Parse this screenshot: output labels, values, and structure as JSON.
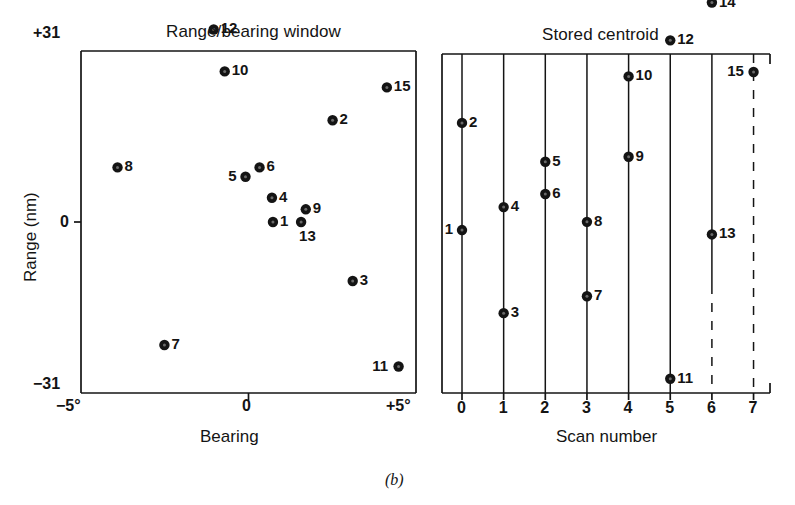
{
  "figure": {
    "caption": "(b)",
    "width": 795,
    "height": 505,
    "ink_color": "#141414",
    "background": "#ffffff"
  },
  "chart_data": [
    {
      "type": "scatter",
      "title": "Range/bearing window",
      "xlabel": "Bearing",
      "ylabel": "Range (nm)",
      "xlim": [
        -5,
        5
      ],
      "ylim": [
        -31,
        31
      ],
      "xtick_labels": [
        "−5°",
        "0",
        "+5°"
      ],
      "xtick_values": [
        -5,
        0,
        5
      ],
      "ytick_labels": [
        "+31",
        "0",
        "−31"
      ],
      "ytick_values": [
        31,
        0,
        -31
      ],
      "grid": false,
      "marker": "filled-circle-with-dot",
      "points": [
        {
          "label": "1",
          "x": 0.73,
          "y": 0.0,
          "label_side": "right"
        },
        {
          "label": "2",
          "x": 2.51,
          "y": 18.45,
          "label_side": "right"
        },
        {
          "label": "3",
          "x": 3.11,
          "y": -10.7,
          "label_side": "right"
        },
        {
          "label": "4",
          "x": 0.7,
          "y": 4.4,
          "label_side": "right"
        },
        {
          "label": "5",
          "x": -0.09,
          "y": 8.2,
          "label_side": "left"
        },
        {
          "label": "6",
          "x": 0.33,
          "y": 9.9,
          "label_side": "right"
        },
        {
          "label": "7",
          "x": -2.51,
          "y": -22.3,
          "label_side": "right"
        },
        {
          "label": "8",
          "x": -3.91,
          "y": 9.9,
          "label_side": "right"
        },
        {
          "label": "9",
          "x": 1.71,
          "y": 2.3,
          "label_side": "right"
        },
        {
          "label": "10",
          "x": -0.71,
          "y": 27.3,
          "label_side": "right"
        },
        {
          "label": "11",
          "x": 4.48,
          "y": -26.2,
          "label_side": "left"
        },
        {
          "label": "12",
          "x": -1.04,
          "y": 34.9,
          "label_side": "right"
        },
        {
          "label": "13",
          "x": 1.57,
          "y": 0.0,
          "label_side": "below-right"
        },
        {
          "label": "14",
          "x": -1.4,
          "y": 41.6,
          "label_side": "right"
        },
        {
          "label": "15",
          "x": 4.13,
          "y": 24.4,
          "label_side": "right"
        }
      ]
    },
    {
      "type": "scatter",
      "title": "Stored centroid",
      "xlabel": "Scan number",
      "ylabel": "Range (nm)",
      "xlim": [
        -0.5,
        7.5
      ],
      "ylim": [
        -31,
        31
      ],
      "xtick_labels": [
        "0",
        "1",
        "2",
        "3",
        "4",
        "5",
        "6",
        "7"
      ],
      "xtick_values": [
        0,
        1,
        2,
        3,
        4,
        5,
        6,
        7
      ],
      "grid": true,
      "grid_note": "vertical line at every scan number; scan 6 lower half and scan 7 fully dashed",
      "marker": "filled-circle-with-dot",
      "points": [
        {
          "label": "1",
          "scan": 0,
          "y": -1.2,
          "label_side": "left"
        },
        {
          "label": "2",
          "scan": 0,
          "y": 18.4,
          "label_side": "right"
        },
        {
          "label": "3",
          "scan": 1,
          "y": -16.4,
          "label_side": "right"
        },
        {
          "label": "4",
          "scan": 1,
          "y": 3.0,
          "label_side": "right"
        },
        {
          "label": "5",
          "scan": 2,
          "y": 11.3,
          "label_side": "right"
        },
        {
          "label": "6",
          "scan": 2,
          "y": 5.4,
          "label_side": "right"
        },
        {
          "label": "7",
          "scan": 3,
          "y": -13.3,
          "label_side": "right"
        },
        {
          "label": "8",
          "scan": 3,
          "y": 0.3,
          "label_side": "right"
        },
        {
          "label": "9",
          "scan": 4,
          "y": 12.2,
          "label_side": "right"
        },
        {
          "label": "10",
          "scan": 4,
          "y": 26.9,
          "label_side": "right"
        },
        {
          "label": "11",
          "scan": 5,
          "y": -28.4,
          "label_side": "right"
        },
        {
          "label": "12",
          "scan": 5,
          "y": 33.5,
          "label_side": "right"
        },
        {
          "label": "13",
          "scan": 6,
          "y": -2.0,
          "label_side": "right"
        },
        {
          "label": "14",
          "scan": 6,
          "y": 40.4,
          "label_side": "right"
        },
        {
          "label": "15",
          "scan": 7,
          "y": 27.7,
          "label_side": "left"
        }
      ]
    }
  ]
}
